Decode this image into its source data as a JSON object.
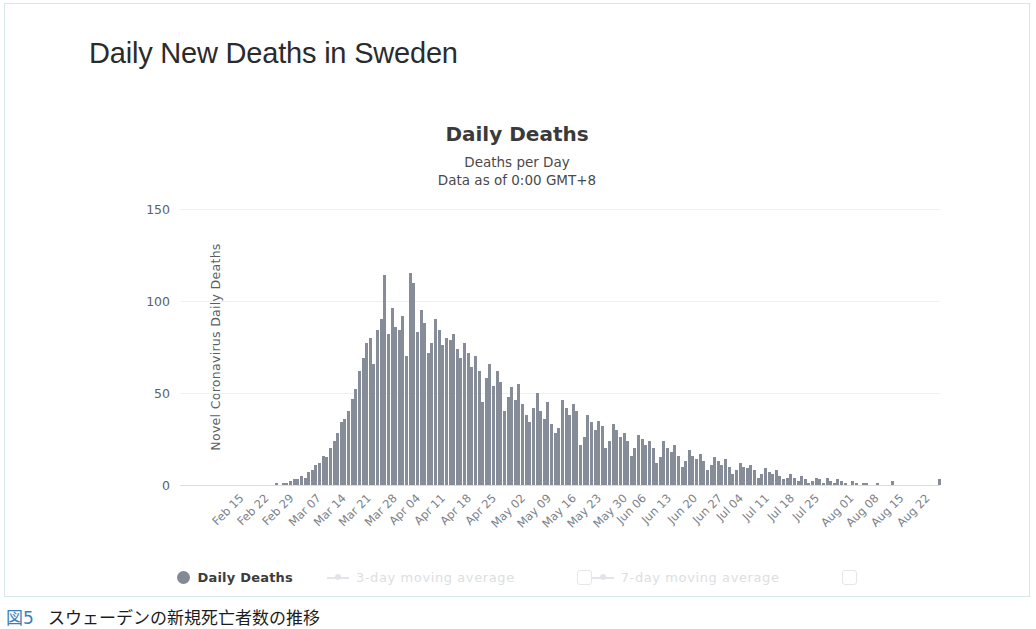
{
  "page": {
    "title": "Daily New Deaths in Sweden",
    "caption_number": "図5",
    "caption_text": "スウェーデンの新規死亡者数の推移"
  },
  "legend": {
    "items": [
      {
        "label": "Daily Deaths",
        "marker": "dot",
        "active": true,
        "has_checkbox": false
      },
      {
        "label": "3-day moving average",
        "marker": "line-marker",
        "active": false,
        "has_checkbox": true
      },
      {
        "label": "7-day moving average",
        "marker": "line-marker",
        "active": false,
        "has_checkbox": true
      }
    ]
  },
  "colors": {
    "bar": "#868d98",
    "frame": "#d7e8ea",
    "grid": "#f0f0f0",
    "axis_text": "#7b818a",
    "caption_accent": "#3a7fc1"
  },
  "chart_data": {
    "type": "bar",
    "title": "Daily Deaths",
    "subtitle": "Deaths per Day",
    "subtitle2": "Data as of 0:00 GMT+8",
    "xlabel": "",
    "ylabel": "Novel Coronavirus Daily Deaths",
    "ylim": [
      0,
      150
    ],
    "yticks": [
      0,
      50,
      100,
      150
    ],
    "grid": true,
    "legend_position": "bottom",
    "series_name": "Daily Deaths",
    "xtick_labels": [
      "Feb 15",
      "Feb 22",
      "Feb 29",
      "Mar 07",
      "Mar 14",
      "Mar 21",
      "Mar 28",
      "Apr 04",
      "Apr 11",
      "Apr 18",
      "Apr 25",
      "May 02",
      "May 09",
      "May 16",
      "May 23",
      "May 30",
      "Jun 06",
      "Jun 13",
      "Jun 20",
      "Jun 27",
      "Jul 04",
      "Jul 11",
      "Jul 18",
      "Jul 25",
      "Aug 01",
      "Aug 08",
      "Aug 15",
      "Aug 22"
    ],
    "xtick_every": 7,
    "x_start": "Feb 15",
    "x_end": "Aug 25",
    "values": [
      0,
      0,
      0,
      0,
      0,
      0,
      0,
      0,
      0,
      0,
      0,
      0,
      0,
      0,
      0,
      0,
      0,
      0,
      0,
      0,
      0,
      0,
      0,
      0,
      0,
      0,
      1,
      0,
      1,
      1,
      2,
      3,
      3,
      5,
      4,
      7,
      8,
      11,
      12,
      16,
      15,
      20,
      24,
      28,
      34,
      36,
      40,
      47,
      52,
      62,
      69,
      77,
      80,
      66,
      84,
      90,
      114,
      82,
      96,
      86,
      84,
      92,
      70,
      115,
      110,
      83,
      95,
      88,
      72,
      77,
      90,
      84,
      76,
      80,
      79,
      82,
      74,
      69,
      77,
      72,
      64,
      70,
      62,
      45,
      58,
      66,
      54,
      62,
      56,
      40,
      48,
      53,
      46,
      55,
      44,
      38,
      34,
      42,
      50,
      40,
      36,
      45,
      33,
      28,
      31,
      46,
      42,
      38,
      44,
      40,
      22,
      26,
      38,
      34,
      30,
      35,
      32,
      20,
      24,
      33,
      30,
      26,
      28,
      24,
      16,
      20,
      27,
      25,
      22,
      24,
      20,
      12,
      15,
      24,
      20,
      18,
      22,
      16,
      10,
      13,
      19,
      16,
      14,
      17,
      13,
      8,
      11,
      15,
      13,
      11,
      14,
      10,
      6,
      8,
      12,
      10,
      9,
      11,
      8,
      4,
      6,
      9,
      7,
      6,
      8,
      5,
      3,
      4,
      6,
      4,
      2,
      5,
      3,
      1,
      2,
      4,
      3,
      1,
      4,
      2,
      1,
      3,
      2,
      1,
      0,
      2,
      1,
      0,
      1,
      1,
      0,
      0,
      1,
      0,
      0,
      0,
      2,
      0,
      0,
      0,
      0,
      0,
      0,
      0,
      0,
      0,
      0,
      0,
      0,
      3
    ]
  }
}
